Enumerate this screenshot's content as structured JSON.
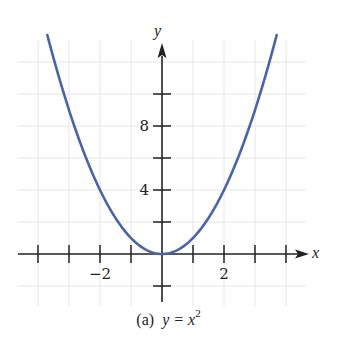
{
  "chart_data": {
    "type": "line",
    "function": "y = x^2",
    "xlabel": "x",
    "ylabel": "y",
    "xlim": [
      -4.6,
      4.6
    ],
    "ylim": [
      -1.9,
      13.8
    ],
    "x_ticks": [
      -4,
      -3,
      -2,
      -1,
      1,
      2,
      3,
      4
    ],
    "x_tick_labels": [
      {
        "value": -2,
        "label": "−2"
      },
      {
        "value": 2,
        "label": "2"
      }
    ],
    "y_ticks": [
      -2,
      2,
      4,
      6,
      8,
      10
    ],
    "y_tick_labels": [
      {
        "value": 4,
        "label": "4"
      },
      {
        "value": 8,
        "label": "8"
      }
    ],
    "grid": true,
    "series": [
      {
        "name": "y = x^2",
        "color": "#4a64a8",
        "x": [
          -3.7,
          -3,
          -2,
          -1,
          0,
          1,
          2,
          3,
          3.7
        ],
        "y": [
          13.69,
          9,
          4,
          1,
          0,
          1,
          4,
          9,
          13.69
        ]
      }
    ]
  },
  "caption": {
    "prefix": "(a)",
    "equation": "y = x",
    "exponent": "2"
  },
  "colors": {
    "curve": "#4a64a8",
    "axis": "#222222",
    "grid": "#e6e6e6"
  }
}
